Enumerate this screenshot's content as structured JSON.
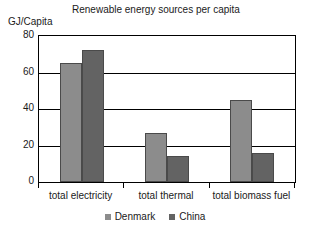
{
  "chart_data": {
    "type": "bar",
    "title": "Renewable energy sources per capita",
    "xlabel": "",
    "ylabel": "GJ/Capita",
    "ylim": [
      0,
      80
    ],
    "yticks": [
      0,
      20,
      40,
      60,
      80
    ],
    "grid": true,
    "legend_position": "bottom-center",
    "categories": [
      "total electricity",
      "total thermal",
      "total biomass fuel"
    ],
    "series": [
      {
        "name": "Denmark",
        "color": "#8c8c8c",
        "values": [
          65,
          27,
          45
        ]
      },
      {
        "name": "China",
        "color": "#636363",
        "values": [
          72.5,
          14,
          16
        ]
      }
    ]
  },
  "axis": {
    "y_title": "GJ/Capita",
    "y_tick_labels": [
      "80",
      "60",
      "40",
      "20",
      "0"
    ]
  },
  "legend": {
    "items": [
      {
        "label": "Denmark",
        "color": "#8c8c8c",
        "marker": "square-marker"
      },
      {
        "label": "China",
        "color": "#636363",
        "marker": "square-marker"
      }
    ]
  }
}
